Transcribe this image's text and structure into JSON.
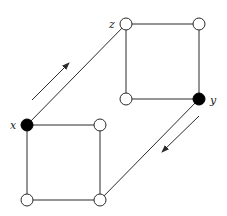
{
  "diagram": {
    "type": "graph",
    "colors": {
      "edge": "#2a2a2a",
      "filled_node": "#000000",
      "hollow_node_fill": "#ffffff",
      "background": "#ffffff"
    },
    "nodes": [
      {
        "id": "z",
        "label": "z",
        "x": 126,
        "y": 24,
        "filled": false
      },
      {
        "id": "upper_top_right",
        "label": "",
        "x": 199,
        "y": 24,
        "filled": false
      },
      {
        "id": "upper_bottom_left",
        "label": "",
        "x": 126,
        "y": 99,
        "filled": false
      },
      {
        "id": "y",
        "label": "y",
        "x": 199,
        "y": 99,
        "filled": true
      },
      {
        "id": "x",
        "label": "x",
        "x": 27,
        "y": 125,
        "filled": true
      },
      {
        "id": "lower_top_right",
        "label": "",
        "x": 100,
        "y": 125,
        "filled": false
      },
      {
        "id": "lower_bottom_left",
        "label": "",
        "x": 27,
        "y": 200,
        "filled": false
      },
      {
        "id": "lower_bottom_right",
        "label": "",
        "x": 100,
        "y": 200,
        "filled": false
      }
    ],
    "edges": [
      [
        "z",
        "upper_top_right"
      ],
      [
        "z",
        "upper_bottom_left"
      ],
      [
        "upper_top_right",
        "y"
      ],
      [
        "upper_bottom_left",
        "y"
      ],
      [
        "x",
        "lower_top_right"
      ],
      [
        "x",
        "lower_bottom_left"
      ],
      [
        "lower_top_right",
        "lower_bottom_right"
      ],
      [
        "lower_bottom_left",
        "lower_bottom_right"
      ],
      [
        "x",
        "z"
      ],
      [
        "y",
        "lower_bottom_right"
      ]
    ],
    "arrows": [
      {
        "name": "arrow-x-to-z",
        "from": [
          32,
          100
        ],
        "to": [
          69,
          63
        ]
      },
      {
        "name": "arrow-y-to-bottom",
        "from": [
          199,
          116
        ],
        "to": [
          162,
          152
        ]
      }
    ],
    "labels": {
      "x": "x",
      "y": "y",
      "z": "z"
    }
  }
}
